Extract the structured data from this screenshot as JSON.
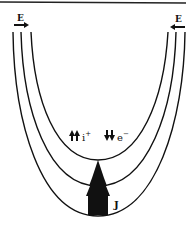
{
  "diagram": {
    "labels": {
      "field_left": "E",
      "field_right": "E",
      "ion": "i",
      "ion_charge": "+",
      "electron": "e",
      "electron_charge": "−",
      "current": "J"
    },
    "curves": 3,
    "colors": {
      "stroke": "#111111",
      "background": "#ffffff"
    }
  }
}
